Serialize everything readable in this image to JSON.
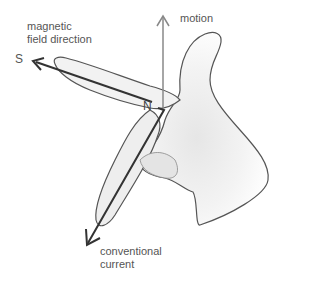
{
  "diagram": {
    "labels": {
      "magnetic_field_line1": "magnetic",
      "magnetic_field_line2": "field direction",
      "south_pole": "S",
      "north_pole": "N",
      "motion": "motion",
      "current_line1": "conventional",
      "current_line2": "current"
    },
    "colors": {
      "arrow_field": "#333333",
      "arrow_current": "#333333",
      "arrow_motion": "#888888",
      "hand_outline": "#555555",
      "hand_shading": "#d8d8d8",
      "text": "#555555"
    }
  }
}
